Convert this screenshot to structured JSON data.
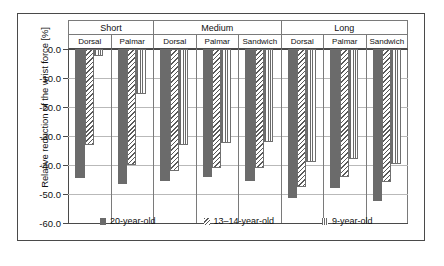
{
  "chart_data": {
    "type": "bar",
    "title": "",
    "subtitle": "",
    "xlabel": "",
    "ylabel": "Relative reduction of the wrist force [%]",
    "ylim": [
      -60.0,
      0.0
    ],
    "ytick_labels": [
      "0.0",
      "-10.0",
      "-20.0",
      "-30.0",
      "-40.0",
      "-50.0",
      "-60.0"
    ],
    "ytick_values": [
      0.0,
      -10.0,
      -20.0,
      -30.0,
      -40.0,
      -50.0,
      -60.0
    ],
    "grid": true,
    "legend_position": "inside-bottom",
    "orientation": "vertical",
    "groups": [
      {
        "label": "Short",
        "subgroups": [
          {
            "label": "Dorsal",
            "values": [
              -44.5,
              -33.0,
              -2.5
            ]
          },
          {
            "label": "Palmar",
            "values": [
              -46.5,
              -40.0,
              -15.5
            ]
          }
        ]
      },
      {
        "label": "Medium",
        "subgroups": [
          {
            "label": "Dorsal",
            "values": [
              -45.5,
              -42.0,
              -33.0
            ]
          },
          {
            "label": "Palmar",
            "values": [
              -44.0,
              -41.0,
              -32.5
            ]
          },
          {
            "label": "Sandwich",
            "values": [
              -45.5,
              -41.0,
              -32.0
            ]
          }
        ]
      },
      {
        "label": "Long",
        "subgroups": [
          {
            "label": "Dorsal",
            "values": [
              -51.5,
              -47.5,
              -39.0
            ]
          },
          {
            "label": "Palmar",
            "values": [
              -48.0,
              -44.0,
              -38.0
            ]
          },
          {
            "label": "Sandwich",
            "values": [
              -52.5,
              -46.0,
              -39.5
            ]
          }
        ]
      }
    ],
    "series": [
      {
        "name": "20-year-old",
        "pattern": "solid",
        "color": "#6b6b6b"
      },
      {
        "name": "13–14-year-old",
        "pattern": "diagonal-hatch",
        "color": "#5a5a5a"
      },
      {
        "name": "9-year-old",
        "pattern": "vertical-stripe",
        "color": "#6a6a6a"
      }
    ],
    "legend": [
      "20-year-old",
      "13–14-year-old",
      "9-year-old"
    ]
  }
}
